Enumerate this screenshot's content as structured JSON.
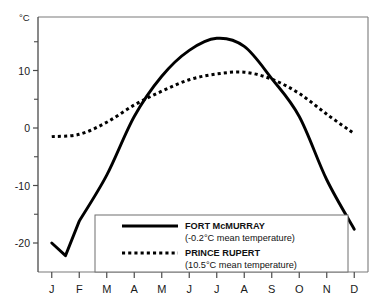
{
  "chart_data": {
    "type": "line",
    "title": "",
    "xlabel": "",
    "ylabel": "°C",
    "unit_label": "°C",
    "categories": [
      "J",
      "F",
      "M",
      "A",
      "M",
      "J",
      "J",
      "A",
      "S",
      "O",
      "N",
      "D"
    ],
    "x_tick_labels": [
      "J",
      "F",
      "M",
      "A",
      "M",
      "J",
      "J",
      "A",
      "S",
      "O",
      "N",
      "D"
    ],
    "y_tick_labels": [
      "10",
      "0",
      "-10",
      "-20"
    ],
    "y_tick_values": [
      10,
      0,
      -10,
      -20
    ],
    "y_minor_tick_values": [
      15,
      5,
      -5,
      -15
    ],
    "ylim": [
      -25,
      18
    ],
    "grid": false,
    "legend_position": "bottom-center",
    "series": [
      {
        "name": "FORT McMURRAY",
        "style": "solid",
        "color": "#000000",
        "annotation": "(-0.2°C mean temperature)",
        "mean": -0.2,
        "values": [
          -20.0,
          -16.2,
          -8.2,
          2.0,
          9.0,
          13.5,
          15.6,
          14.2,
          8.6,
          2.0,
          -9.0,
          -17.6
        ]
      },
      {
        "name": "PRINCE RUPERT",
        "style": "dotted",
        "color": "#000000",
        "annotation": "(10.5°C mean temperature)",
        "mean": 10.5,
        "values": [
          -1.5,
          -1.1,
          1.0,
          4.0,
          6.4,
          8.4,
          9.4,
          9.7,
          8.5,
          6.0,
          2.4,
          -1.0
        ]
      }
    ]
  },
  "legend": {
    "entries": [
      {
        "label": "FORT McMURRAY",
        "sub": "(-0.2°C mean temperature)",
        "style": "solid"
      },
      {
        "label": "PRINCE RUPERT",
        "sub": "(10.5°C mean temperature)",
        "style": "dotted"
      }
    ]
  },
  "axis": {
    "y_unit": "°C",
    "y_labels": [
      "10",
      "0",
      "-10",
      "-20"
    ],
    "x_labels": [
      "J",
      "F",
      "M",
      "A",
      "M",
      "J",
      "J",
      "A",
      "S",
      "O",
      "N",
      "D"
    ]
  }
}
